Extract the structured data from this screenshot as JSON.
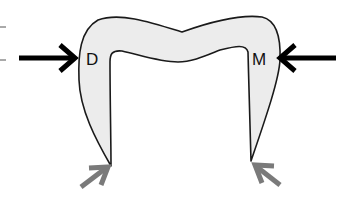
{
  "diagram": {
    "labels": {
      "left": "D",
      "right": "M"
    },
    "colors": {
      "fill": "#ececec",
      "outline": "#1a1a1a",
      "force_arrow": "#000000",
      "reaction_arrow": "#7a7a7a",
      "tick": "#555555"
    },
    "arrows": [
      {
        "name": "left-force-arrow",
        "direction": "right"
      },
      {
        "name": "right-force-arrow",
        "direction": "left"
      },
      {
        "name": "left-reaction-arrow",
        "direction": "up-right"
      },
      {
        "name": "right-reaction-arrow",
        "direction": "up-left"
      }
    ]
  }
}
